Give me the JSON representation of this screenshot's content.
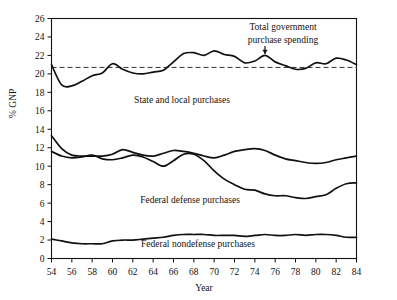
{
  "chart_data": {
    "type": "line",
    "title": "",
    "xlabel": "Year",
    "ylabel": "% GNP",
    "xlim": [
      54,
      84
    ],
    "ylim": [
      0,
      26
    ],
    "ytick_step": 2,
    "xtick_step": 2,
    "grid": false,
    "legend_position": "inline-annotations",
    "x": [
      54,
      55,
      56,
      57,
      58,
      59,
      60,
      61,
      62,
      63,
      64,
      65,
      66,
      67,
      68,
      69,
      70,
      71,
      72,
      73,
      74,
      75,
      76,
      77,
      78,
      79,
      80,
      81,
      82,
      83,
      84
    ],
    "yticks": [
      0,
      2,
      4,
      6,
      8,
      10,
      12,
      14,
      16,
      18,
      20,
      22,
      24,
      26
    ],
    "xticks": [
      54,
      56,
      58,
      60,
      62,
      64,
      66,
      68,
      70,
      72,
      74,
      76,
      78,
      80,
      82,
      84
    ],
    "reference_line": {
      "label": "",
      "value": 20.7,
      "style": "dashed",
      "color": "#333333"
    },
    "series": [
      {
        "name": "Total government purchase spending",
        "label_text": "Total government\npurchase spending",
        "label_line1": "Total government",
        "label_line2": "purchase spending",
        "annotation_arrow": true,
        "annotation_x": 75,
        "color": "#111111",
        "values": [
          21.0,
          18.8,
          18.7,
          19.2,
          19.8,
          20.1,
          21.1,
          20.5,
          20.1,
          20.0,
          20.2,
          20.4,
          21.3,
          22.2,
          22.3,
          22.0,
          22.5,
          22.1,
          21.9,
          21.2,
          21.4,
          22.0,
          21.3,
          20.9,
          20.5,
          20.6,
          21.2,
          21.1,
          21.7,
          21.5,
          21.0
        ]
      },
      {
        "name": "State and local purchases",
        "label_text": "State and local purchases",
        "color": "#111111",
        "values": [
          13.3,
          11.9,
          11.2,
          11.1,
          11.1,
          11.1,
          11.3,
          11.8,
          11.5,
          11.2,
          11.1,
          11.4,
          11.7,
          11.6,
          11.4,
          11.1,
          10.9,
          11.2,
          11.6,
          11.8,
          11.9,
          11.7,
          11.2,
          10.8,
          10.6,
          10.4,
          10.3,
          10.4,
          10.7,
          10.9,
          11.1
        ]
      },
      {
        "name": "Federal defense purchases",
        "label_text": "Federal defense purchases",
        "color": "#111111",
        "values": [
          11.6,
          11.1,
          10.9,
          11.0,
          11.2,
          10.8,
          10.7,
          10.9,
          11.2,
          11.0,
          10.5,
          10.0,
          10.6,
          11.3,
          11.3,
          10.6,
          9.5,
          8.6,
          8.0,
          7.5,
          7.4,
          7.0,
          6.8,
          6.8,
          6.6,
          6.5,
          6.7,
          6.9,
          7.6,
          8.1,
          8.2
        ]
      },
      {
        "name": "Federal nondefense purchases",
        "label_text": "Federal nondefense purchases",
        "color": "#111111",
        "values": [
          2.1,
          1.9,
          1.7,
          1.6,
          1.6,
          1.6,
          1.9,
          2.0,
          2.0,
          2.1,
          2.2,
          2.3,
          2.5,
          2.6,
          2.6,
          2.6,
          2.5,
          2.5,
          2.5,
          2.4,
          2.5,
          2.6,
          2.5,
          2.5,
          2.6,
          2.5,
          2.6,
          2.6,
          2.5,
          2.3,
          2.3
        ]
      }
    ]
  },
  "labels": {
    "total_line1": "Total government",
    "total_line2": "purchase spending",
    "state_local": "State and local purchases",
    "fed_defense": "Federal defense purchases",
    "fed_nondefense": "Federal nondefense purchases",
    "x_axis_title": "Year",
    "y_axis_title": "% GNP"
  },
  "ticks": {
    "y": [
      "0",
      "2",
      "4",
      "6",
      "8",
      "10",
      "12",
      "14",
      "16",
      "18",
      "20",
      "22",
      "24",
      "26"
    ],
    "x": [
      "54",
      "56",
      "58",
      "60",
      "62",
      "64",
      "66",
      "68",
      "70",
      "72",
      "74",
      "76",
      "78",
      "80",
      "82",
      "84"
    ]
  }
}
